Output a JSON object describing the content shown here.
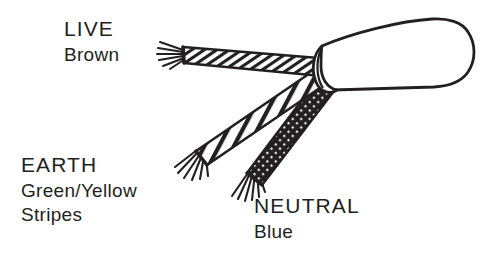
{
  "figure": {
    "background_color": "#ffffff",
    "ink_color": "#231f20"
  },
  "labels": {
    "live": {
      "name": "LIVE",
      "colour": "Brown"
    },
    "earth": {
      "name": "EARTH",
      "colour": "Green/Yellow",
      "pattern": "Stripes"
    },
    "neutral": {
      "name": "NEUTRAL",
      "colour": "Blue"
    }
  },
  "illustration": {
    "outer_sheath_name": "outer-sheath",
    "live_conductor_name": "live-wire",
    "earth_conductor_name": "earth-wire",
    "neutral_conductor_name": "neutral-wire"
  }
}
